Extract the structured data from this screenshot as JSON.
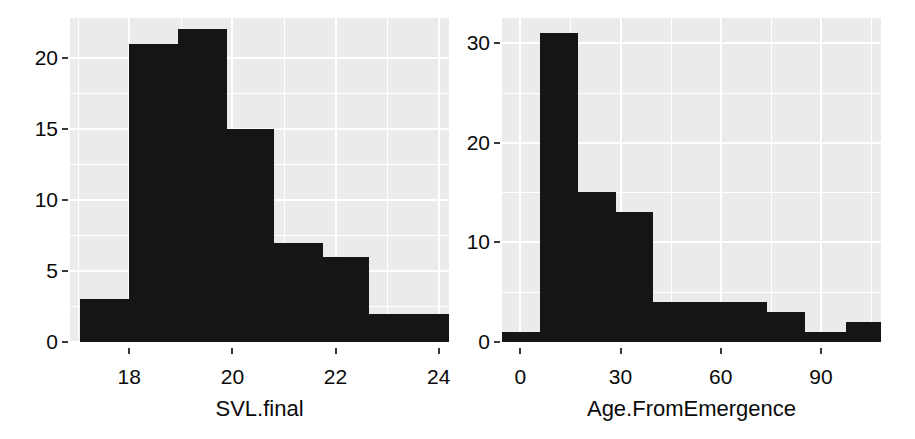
{
  "figure": {
    "background": "#ffffff",
    "panel_background": "#ebebeb",
    "grid_color": "#ffffff",
    "bar_color": "#151515",
    "text_color": "#0a0a0a"
  },
  "chart_data": [
    {
      "type": "bar",
      "subtype": "histogram",
      "panel": "left",
      "title": "",
      "xlabel": "SVL.final",
      "ylabel": "",
      "xlim": [
        16.85,
        24.2
      ],
      "ylim": [
        0,
        22.8
      ],
      "xticks": [
        18,
        20,
        22,
        24
      ],
      "xtick_labels": [
        "18",
        "20",
        "22",
        "24"
      ],
      "yticks": [
        0,
        5,
        10,
        15,
        20
      ],
      "ytick_labels": [
        "0",
        "5",
        "10",
        "15",
        "20"
      ],
      "grid": true,
      "grid_major_x": [
        18,
        20,
        22,
        24
      ],
      "grid_minor_x": [
        17,
        19,
        21,
        23
      ],
      "grid_major_y": [
        0,
        5,
        10,
        15,
        20
      ],
      "grid_minor_y": [
        2.5,
        7.5,
        12.5,
        17.5
      ],
      "legend": null,
      "bin_edges": [
        17.05,
        18.0,
        18.95,
        19.9,
        20.8,
        21.75,
        22.65,
        24.2
      ],
      "categories": [
        "17.05-18.0",
        "18.0-18.95",
        "18.95-19.9",
        "19.9-20.8",
        "20.8-21.75",
        "21.75-22.65",
        "22.65-24.2"
      ],
      "values": [
        3,
        21,
        22,
        15,
        7,
        6,
        2
      ]
    },
    {
      "type": "bar",
      "subtype": "histogram",
      "panel": "right",
      "title": "",
      "xlabel": "Age.FromEmergence",
      "ylabel": "",
      "xlim": [
        -5.5,
        108
      ],
      "ylim": [
        0,
        32.5
      ],
      "xticks": [
        0,
        30,
        60,
        90
      ],
      "xtick_labels": [
        "0",
        "30",
        "60",
        "90"
      ],
      "yticks": [
        0,
        10,
        20,
        30
      ],
      "ytick_labels": [
        "0",
        "10",
        "20",
        "30"
      ],
      "grid": true,
      "grid_major_x": [
        0,
        30,
        60,
        90
      ],
      "grid_minor_x": [
        15,
        45,
        75,
        105
      ],
      "grid_major_y": [
        0,
        10,
        20,
        30
      ],
      "grid_minor_y": [
        5,
        15,
        25
      ],
      "legend": null,
      "bin_edges": [
        -5.5,
        5.8,
        17.2,
        28.5,
        39.7,
        73.8,
        85.2,
        97.5,
        108
      ],
      "categories": [
        "-5.5-5.8",
        "5.8-17.2",
        "17.2-28.5",
        "28.5-39.7",
        "39.7-73.8",
        "73.8-85.2",
        "85.2-97.5",
        "97.5-108"
      ],
      "values": [
        1,
        31,
        15,
        13,
        4,
        3,
        1,
        2
      ]
    }
  ]
}
